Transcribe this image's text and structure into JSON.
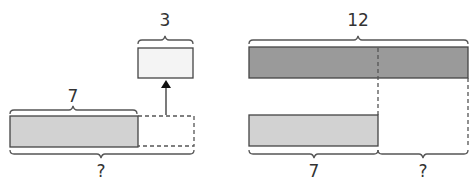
{
  "colors": {
    "dark_bar": "#9a9a9a",
    "light_bar": "#d2d2d2",
    "small_box": "#f4f4f4",
    "stroke": "#444444"
  },
  "left_diagram": {
    "small_box_label": "3",
    "bar_label": "7",
    "total_label": "?"
  },
  "right_diagram": {
    "total_label": "12",
    "known_part_label": "7",
    "unknown_part_label": "?"
  }
}
